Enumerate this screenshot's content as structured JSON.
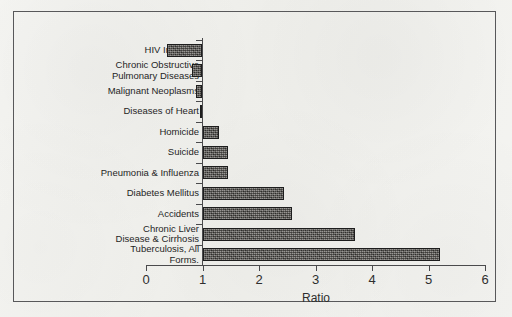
{
  "chart_data": {
    "type": "bar",
    "orientation": "horizontal",
    "title": "",
    "xlabel": "Ratio",
    "ylabel": "",
    "xlim": [
      0,
      6
    ],
    "xticks": [
      "0",
      "1",
      "2",
      "3",
      "4",
      "5",
      "6"
    ],
    "baseline": 1,
    "grid": false,
    "legend": null,
    "categories": [
      "HIV Infection",
      "Chronic Obstructive Pulmonary Diseases",
      "Malignant Neoplasms",
      "Diseases of Heart",
      "Homicide",
      "Suicide",
      "Pneumonia & Influenza",
      "Diabetes Mellitus",
      "Accidents",
      "Chronic Liver Disease & Cirrhosis",
      "Tuberculosis, All Forms."
    ],
    "category_label_lines": [
      [
        "HIV Infection"
      ],
      [
        "Chronic Obstructive",
        "Pulmonary Diseases"
      ],
      [
        "Malignant Neoplasms"
      ],
      [
        "Diseases of Heart"
      ],
      [
        "Homicide"
      ],
      [
        "Suicide"
      ],
      [
        "Pneumonia & Influenza"
      ],
      [
        "Diabetes Mellitus"
      ],
      [
        "Accidents"
      ],
      [
        "Chronic Liver",
        "Disease & Cirrhosis"
      ],
      [
        "Tuberculosis, All",
        "Forms."
      ]
    ],
    "values": [
      0.38,
      0.82,
      0.89,
      0.96,
      1.3,
      1.45,
      1.45,
      2.45,
      2.58,
      3.7,
      5.2
    ],
    "bar_color": "#5d5a55",
    "bar_edge_color": "#1d1d1d",
    "axis_color": "#4a4a4c",
    "background_color": "#f2f2ef"
  },
  "axis": {
    "x_title": "Ratio"
  }
}
